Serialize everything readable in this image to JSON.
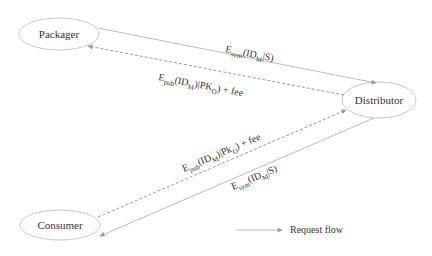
{
  "diagram": {
    "nodes": [
      {
        "id": "packager",
        "label": "Packager"
      },
      {
        "id": "distributor",
        "label": "Distributor"
      },
      {
        "id": "consumer",
        "label": "Consumer"
      }
    ],
    "edges": [
      {
        "from": "packager",
        "to": "distributor",
        "style": "solid",
        "label": {
          "main": "E",
          "sub": "sym",
          "arg_open": "(ID",
          "arg_sub": "M",
          "arg_rest": "|S)"
        }
      },
      {
        "from": "distributor",
        "to": "packager",
        "style": "dashed",
        "label": {
          "main": "E",
          "sub": "pub",
          "arg_open": "(ID",
          "arg_sub": "M",
          "arg_rest": ")|PK",
          "pk_sub": "O",
          "tail": ") + fee"
        }
      },
      {
        "from": "consumer",
        "to": "distributor",
        "style": "dashed",
        "label": {
          "main": "E",
          "sub": "pub",
          "arg_open": "(ID",
          "arg_sub": "M",
          "arg_rest": ")|Pk",
          "pk_sub": "O",
          "tail": ") + fee"
        }
      },
      {
        "from": "distributor",
        "to": "consumer",
        "style": "solid",
        "label": {
          "main": "E",
          "sub": "sym",
          "arg_open": "(ID",
          "arg_sub": "M",
          "arg_rest": "|S)"
        }
      }
    ],
    "legend": {
      "label": "Request flow"
    },
    "colors": {
      "stroke": "#bbbbbb",
      "arrow": "#999999",
      "text": "#333333"
    }
  }
}
